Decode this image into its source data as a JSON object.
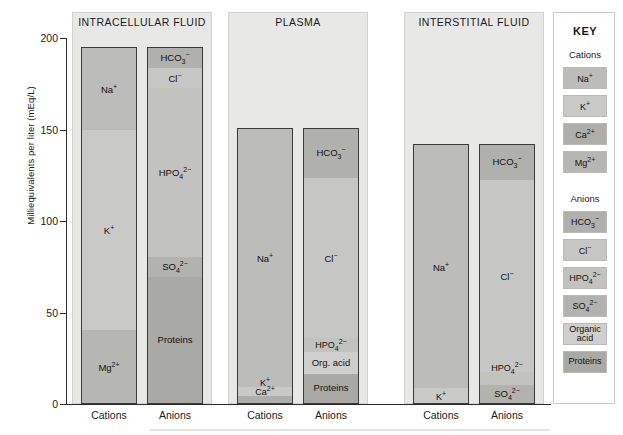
{
  "axis": {
    "ylabel": "Milliequivalents per liter (mEq/L)",
    "ticks": [
      "200",
      "150",
      "100",
      "50",
      "0"
    ],
    "cations_label": "Cations",
    "anions_label": "Anions"
  },
  "panels": {
    "icf_title": "INTRACELLULAR FLUID",
    "plasma_title": "PLASMA",
    "isf_title": "INTERSTITIAL FLUID"
  },
  "key": {
    "title": "KEY",
    "cations_heading": "Cations",
    "anions_heading": "Anions",
    "cations": [
      {
        "label": "Na<sup>+</sup>",
        "color": "#bcbcba"
      },
      {
        "label": "K<sup>+</sup>",
        "color": "#c9c9c7"
      },
      {
        "label": "Ca<sup>2+</sup>",
        "color": "#aeaeab"
      },
      {
        "label": "Mg<sup>2+</sup>",
        "color": "#b6b6b3"
      }
    ],
    "anions": [
      {
        "label": "HCO<sub>3</sub><sup>&minus;</sup>",
        "color": "#b0b0ad"
      },
      {
        "label": "Cl<sup>&minus;</sup>",
        "color": "#c6c6c4"
      },
      {
        "label": "HPO<sub>4</sub><sup>2&minus;</sup>",
        "color": "#c2c2bf"
      },
      {
        "label": "SO<sub>4</sub><sup>2&minus;</sup>",
        "color": "#b2b2af"
      },
      {
        "label": "Organic<br>acid",
        "color": "#cfcfcd"
      },
      {
        "label": "Proteins",
        "color": "#a9a9a6"
      }
    ]
  },
  "chart_data": {
    "type": "bar",
    "ylabel": "Milliequivalents per liter (mEq/L)",
    "xlabel": "",
    "ylim": [
      0,
      200
    ],
    "yticks": [
      0,
      50,
      100,
      150,
      200
    ],
    "grid": false,
    "legend_position": "right",
    "stacked": true,
    "units": "mEq/L",
    "compartments": [
      {
        "name": "INTRACELLULAR FLUID",
        "bars": [
          {
            "category": "Cations",
            "total": 195,
            "segments": [
              {
                "name": "Na+",
                "label": "Na<sup>+</sup>",
                "value": 45,
                "from": 150,
                "to": 195,
                "color": "#bcbcba"
              },
              {
                "name": "K+",
                "label": "K<sup>+</sup>",
                "value": 110,
                "from": 40,
                "to": 150,
                "color": "#c9c9c7"
              },
              {
                "name": "Mg2+",
                "label": "Mg<sup>2+</sup>",
                "value": 40,
                "from": 0,
                "to": 40,
                "color": "#b6b6b3"
              }
            ]
          },
          {
            "category": "Anions",
            "total": 195,
            "segments": [
              {
                "name": "HCO3-",
                "label": "HCO<sub>3</sub><sup>&minus;</sup>",
                "value": 11,
                "from": 184,
                "to": 195,
                "color": "#b0b0ad"
              },
              {
                "name": "Cl-",
                "label": "Cl<sup>&minus;</sup>",
                "value": 11,
                "from": 173,
                "to": 184,
                "color": "#c6c6c4"
              },
              {
                "name": "HPO42-",
                "label": "HPO<sub>4</sub><sup>2&minus;</sup>",
                "value": 93,
                "from": 80,
                "to": 173,
                "color": "#c2c2bf"
              },
              {
                "name": "SO42-",
                "label": "SO<sub>4</sub><sup>2&minus;</sup>",
                "value": 11,
                "from": 69,
                "to": 80,
                "color": "#b2b2af"
              },
              {
                "name": "Proteins",
                "label": "Proteins",
                "value": 69,
                "from": 0,
                "to": 69,
                "color": "#a9a9a6"
              }
            ]
          }
        ]
      },
      {
        "name": "PLASMA",
        "bars": [
          {
            "category": "Cations",
            "total": 151,
            "segments": [
              {
                "name": "Na+",
                "label": "Na<sup>+</sup>",
                "value": 142,
                "from": 9,
                "to": 151,
                "color": "#bcbcba"
              },
              {
                "name": "K+",
                "label": "K<sup>+</sup>",
                "value": 5,
                "from": 4,
                "to": 9,
                "color": "#c9c9c7"
              },
              {
                "name": "Ca2+",
                "label": "Ca<sup>2+</sup>",
                "value": 4,
                "from": 0,
                "to": 4,
                "color": "#aeaeab"
              }
            ]
          },
          {
            "category": "Anions",
            "total": 151,
            "segments": [
              {
                "name": "HCO3-",
                "label": "HCO<sub>3</sub><sup>&minus;</sup>",
                "value": 27,
                "from": 124,
                "to": 151,
                "color": "#b0b0ad"
              },
              {
                "name": "Cl-",
                "label": "Cl<sup>&minus;</sup>",
                "value": 88,
                "from": 36,
                "to": 124,
                "color": "#c6c6c4"
              },
              {
                "name": "HPO42-",
                "label": "HPO<sub>4</sub><sup>2&minus;</sup>",
                "value": 8,
                "from": 28,
                "to": 36,
                "color": "#c2c2bf"
              },
              {
                "name": "Org. acid",
                "label": "Org. acid",
                "value": 12,
                "from": 16,
                "to": 28,
                "color": "#cfcfcd"
              },
              {
                "name": "Proteins",
                "label": "Proteins",
                "value": 16,
                "from": 0,
                "to": 16,
                "color": "#a9a9a6"
              }
            ]
          }
        ]
      },
      {
        "name": "INTERSTITIAL FLUID",
        "bars": [
          {
            "category": "Cations",
            "total": 142,
            "segments": [
              {
                "name": "Na+",
                "label": "Na<sup>+</sup>",
                "value": 134,
                "from": 8,
                "to": 142,
                "color": "#bcbcba"
              },
              {
                "name": "K+",
                "label": "K<sup>+</sup>",
                "value": 8,
                "from": 0,
                "to": 8,
                "color": "#c9c9c7"
              }
            ]
          },
          {
            "category": "Anions",
            "total": 142,
            "segments": [
              {
                "name": "HCO3-",
                "label": "HCO<sub>3</sub><sup>&minus;</sup>",
                "value": 19,
                "from": 123,
                "to": 142,
                "color": "#b0b0ad"
              },
              {
                "name": "Cl-",
                "label": "Cl<sup>&minus;</sup>",
                "value": 106,
                "from": 17,
                "to": 123,
                "color": "#c6c6c4"
              },
              {
                "name": "HPO42-",
                "label": "HPO<sub>4</sub><sup>2&minus;</sup>",
                "value": 7,
                "from": 10,
                "to": 17,
                "color": "#c2c2bf"
              },
              {
                "name": "SO42-",
                "label": "SO<sub>4</sub><sup>2&minus;</sup>",
                "value": 10,
                "from": 0,
                "to": 10,
                "color": "#b2b2af"
              }
            ]
          }
        ]
      }
    ]
  }
}
